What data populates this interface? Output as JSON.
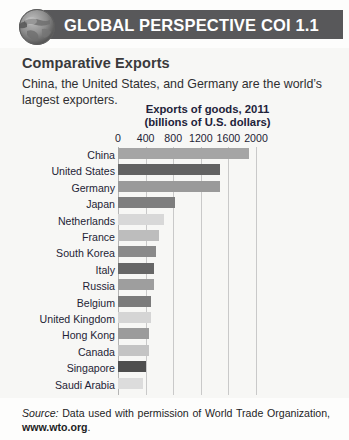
{
  "header": {
    "title": "GLOBAL PERSPECTIVE COI 1.1",
    "bar_color": "#58585a",
    "icon": "globe-icon"
  },
  "panel": {
    "subtitle": "Comparative Exports",
    "lede": "China, the United States, and Germany are the world’s largest exporters.",
    "background": "#f7f7f5"
  },
  "source": {
    "label": "Source:",
    "text": " Data used with permission of World Trade Organization, ",
    "url": "www.wto.org",
    "period": "."
  },
  "chart_data": {
    "type": "bar",
    "orientation": "horizontal",
    "title": "Exports of goods, 2011",
    "subtitle": "(billions of U.S. dollars)",
    "xlabel": "",
    "ylabel": "",
    "xlim": [
      0,
      2200
    ],
    "ticks": [
      0,
      400,
      800,
      1200,
      1600,
      2000
    ],
    "tick_labels": [
      "0",
      "400",
      "800",
      "1200",
      "1600",
      "2000"
    ],
    "grid": true,
    "legend": "none",
    "categories": [
      "China",
      "United States",
      "Germany",
      "Japan",
      "Netherlands",
      "France",
      "South Korea",
      "Italy",
      "Russia",
      "Belgium",
      "United Kingdom",
      "Hong Kong",
      "Canada",
      "Singapore",
      "Saudi Arabia"
    ],
    "values": [
      1899,
      1481,
      1474,
      823,
      661,
      597,
      555,
      523,
      522,
      477,
      473,
      456,
      452,
      410,
      365
    ],
    "bar_colors": [
      "#a5a5a5",
      "#626262",
      "#9a9a9a",
      "#7e7e7e",
      "#d8d8d8",
      "#bdbdbd",
      "#8a8a8a",
      "#676767",
      "#9e9e9e",
      "#7b7b7b",
      "#d5d5d5",
      "#9b9b9b",
      "#c4c4c4",
      "#4e4e4e",
      "#dcdcdc"
    ]
  }
}
